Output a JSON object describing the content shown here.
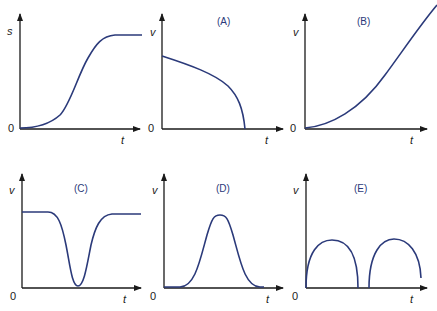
{
  "panels": [
    {
      "id": "s-t",
      "title": "",
      "ylabel": "s",
      "xlabel": "t",
      "origin": "0",
      "curve": "sigmoid rise to plateau"
    },
    {
      "id": "A",
      "title": "(A)",
      "ylabel": "v",
      "xlabel": "t",
      "origin": "0",
      "curve": "starts high, decreases concave-down to zero"
    },
    {
      "id": "B",
      "title": "(B)",
      "ylabel": "v",
      "xlabel": "t",
      "origin": "0",
      "curve": "starts at zero, increases concave-up"
    },
    {
      "id": "C",
      "title": "(C)",
      "ylabel": "v",
      "xlabel": "t",
      "origin": "0",
      "curve": "constant, dips to near zero, returns"
    },
    {
      "id": "D",
      "title": "(D)",
      "ylabel": "v",
      "xlabel": "t",
      "origin": "0",
      "curve": "bell-shaped peak"
    },
    {
      "id": "E",
      "title": "(E)",
      "ylabel": "v",
      "xlabel": "t",
      "origin": "0",
      "curve": "two arches touching zero"
    }
  ],
  "colors": {
    "curve": "#2b3a7a",
    "axis": "#1a1a1a"
  }
}
